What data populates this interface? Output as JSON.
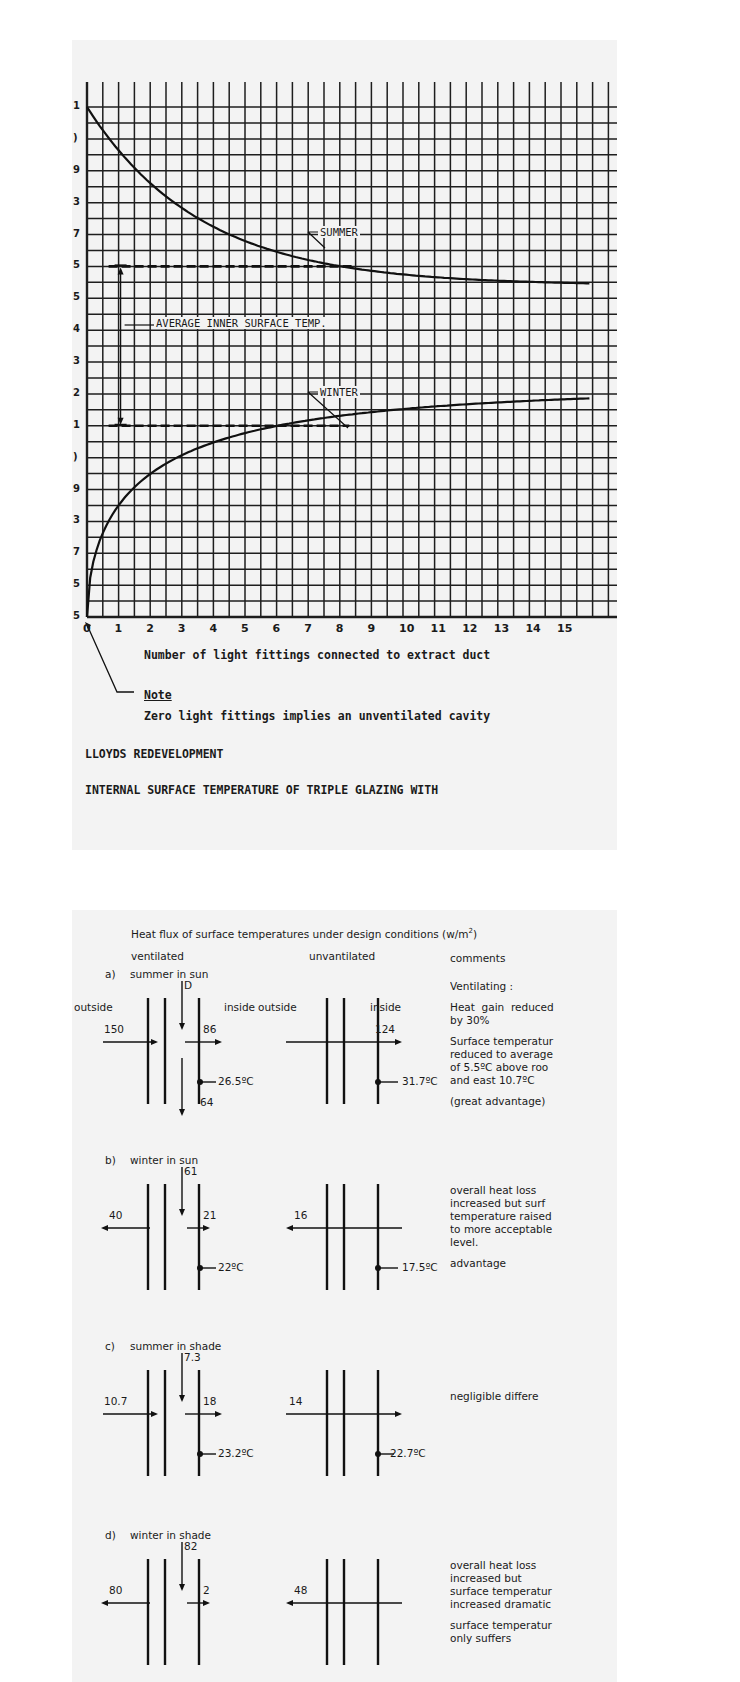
{
  "figure1": {
    "y_tick_glyphs": [
      "1",
      ")",
      "9",
      "3",
      "7",
      "5",
      "5",
      "4",
      "3",
      "2",
      "1",
      ")",
      "9",
      "3",
      "7",
      "5",
      "5"
    ],
    "x_ticks": [
      "0",
      "1",
      "2",
      "3",
      "4",
      "5",
      "6",
      "7",
      "8",
      "9",
      "10",
      "11",
      "12",
      "13",
      "14",
      "15"
    ],
    "xlabel": "Number of light fittings connected to extract duct",
    "annotations": {
      "summer": "SUMMER",
      "winter": "WINTER",
      "average": "AVERAGE INNER SURFACE TEMP."
    },
    "note_heading": "Note",
    "note_text": "Zero light fittings implies an unventilated cavity",
    "project": "LLOYDS REDEVELOPMENT",
    "title": "INTERNAL SURFACE TEMPERATURE OF TRIPLE GLAZING WITH"
  },
  "chart_data": {
    "type": "line",
    "title": "INTERNAL SURFACE TEMPERATURE OF TRIPLE GLAZING WITH",
    "xlabel": "Number of light fittings connected to extract duct",
    "ylabel": "Internal surface temperature (°C)",
    "x": [
      0,
      1,
      2,
      3,
      4,
      5,
      6,
      7,
      8,
      9,
      10,
      11,
      12,
      13,
      14,
      15
    ],
    "series": [
      {
        "name": "SUMMER",
        "values": [
          21.0,
          20.0,
          19.2,
          18.5,
          17.9,
          17.4,
          17.0,
          16.7,
          16.4,
          16.2,
          16.0,
          15.9,
          15.8,
          15.7,
          15.6,
          15.5
        ]
      },
      {
        "name": "WINTER",
        "values": [
          5.0,
          7.2,
          8.3,
          9.0,
          9.6,
          10.1,
          10.5,
          10.8,
          11.0,
          11.2,
          11.4,
          11.5,
          11.7,
          11.8,
          11.9,
          12.0
        ]
      }
    ],
    "reference_lines": [
      {
        "label": "AVERAGE INNER SURFACE TEMP. (summer)",
        "y": 16.0,
        "x_range": [
          1,
          8.5
        ]
      },
      {
        "label": "AVERAGE INNER SURFACE TEMP. (winter)",
        "y": 11.0,
        "x_range": [
          1,
          8.3
        ]
      }
    ],
    "xlim": [
      0,
      15
    ],
    "ylim": [
      5,
      21
    ],
    "grid": true,
    "note": "Zero light fittings implies an unventilated cavity"
  },
  "figure2": {
    "title": "Heat flux of surface temperatures under design conditions (w/m",
    "title_sup": "2",
    "title_close": ")",
    "col_ventilated": "ventilated",
    "col_unventilated": "unvantilated",
    "col_comments": "comments",
    "outside": "outside",
    "inside": "inside",
    "cases": [
      {
        "label": "a)",
        "name": "summer in sun",
        "vent": {
          "top": "D",
          "left": "150",
          "right": "86",
          "bottom": "64",
          "temp": "26.5ºC"
        },
        "unvent": {
          "flux": "124",
          "temp": "31.7ºC"
        },
        "comments": [
          "Ventilating :",
          "Heat  gain  reduced\nby 30%",
          "Surface temperatur\nreduced to average\nof 5.5ºC above roo\nand east 10.7ºC",
          "(great advantage)"
        ]
      },
      {
        "label": "b)",
        "name": "winter in sun",
        "vent": {
          "top": "61",
          "left": "40",
          "right": "21",
          "temp": "22ºC"
        },
        "unvent": {
          "flux": "16",
          "temp": "17.5ºC"
        },
        "comments": [
          "overall heat loss\nincreased but surf\ntemperature raised\nto more acceptable\nlevel.",
          "advantage"
        ]
      },
      {
        "label": "c)",
        "name": "summer in shade",
        "vent": {
          "top": "7.3",
          "left": "10.7",
          "right": "18",
          "temp": "23.2ºC"
        },
        "unvent": {
          "flux": "14",
          "temp": "22.7ºC"
        },
        "comments": [
          "negligible differe"
        ]
      },
      {
        "label": "d)",
        "name": "winter in shade",
        "vent": {
          "top": "82",
          "left": "80",
          "right": "2"
        },
        "unvent": {
          "flux": "48"
        },
        "comments": [
          "overall heat loss\nincreased but\nsurface temperatur\nincreased dramatic",
          "surface temperatur\nonly suffers"
        ]
      }
    ]
  }
}
